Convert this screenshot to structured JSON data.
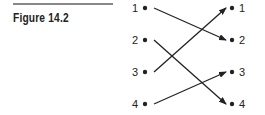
{
  "figure": {
    "caption": "Figure 14.2",
    "left_nodes": [
      "1",
      "2",
      "3",
      "4"
    ],
    "right_nodes": [
      "1",
      "2",
      "3",
      "4"
    ],
    "mappings": [
      {
        "from": "1",
        "to": "2"
      },
      {
        "from": "2",
        "to": "4"
      },
      {
        "from": "3",
        "to": "1"
      },
      {
        "from": "4",
        "to": "3"
      }
    ],
    "colors": {
      "ink": "#222222",
      "rule": "#888888"
    }
  }
}
